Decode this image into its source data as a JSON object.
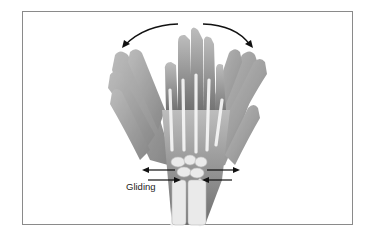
{
  "figure": {
    "labels": {
      "gliding": "Gliding"
    },
    "illustration": "hand-wrist-bones-radial-ulnar-deviation",
    "colors": {
      "skin": "#9a9a9a",
      "bone": "#ececec",
      "arrow": "#111111",
      "frame": "#8a8a8a"
    }
  }
}
